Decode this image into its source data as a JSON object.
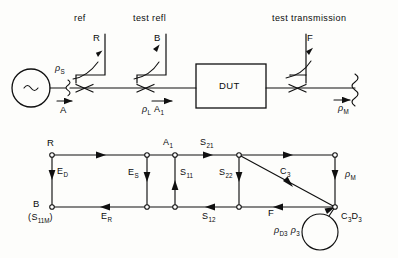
{
  "figure": {
    "line_color": "#101010"
  },
  "top_diagram": {
    "name": "measurement-setup",
    "headers": [
      {
        "id": "ref",
        "text": "ref"
      },
      {
        "id": "test-refl",
        "text": "test refl"
      },
      {
        "id": "test-transmission",
        "text": "test transmission"
      }
    ],
    "source": {
      "symbol": "~",
      "name": "signal-source"
    },
    "dut": {
      "label": "DUT"
    },
    "port_labels": [
      {
        "id": "R",
        "text": "R"
      },
      {
        "id": "B",
        "text": "B"
      },
      {
        "id": "F",
        "text": "F"
      }
    ],
    "wave_labels": [
      {
        "id": "rho-s",
        "rho": "ρ",
        "sub": "S"
      },
      {
        "id": "A",
        "text": "A"
      },
      {
        "id": "rho-L",
        "rho": "ρ",
        "sub": "L"
      },
      {
        "id": "A1",
        "text": "A",
        "sub": "1"
      },
      {
        "id": "rho-M",
        "rho": "ρ",
        "sub": "M"
      }
    ]
  },
  "flow_graph": {
    "name": "signal-flow-graph",
    "nodes": [
      {
        "id": "R",
        "text": "R"
      },
      {
        "id": "B",
        "text": "B"
      },
      {
        "id": "B-alt",
        "text": "(S",
        "sub1": "11M",
        "tail": ")"
      },
      {
        "id": "A1",
        "text": "A",
        "sub": "1"
      },
      {
        "id": "F",
        "text": "F"
      }
    ],
    "branches": [
      {
        "id": "ED",
        "text": "E",
        "sub": "D"
      },
      {
        "id": "ER",
        "text": "E",
        "sub": "R"
      },
      {
        "id": "ES",
        "text": "E",
        "sub": "S"
      },
      {
        "id": "S11",
        "text": "S",
        "sub": "11"
      },
      {
        "id": "S21",
        "text": "S",
        "sub": "21"
      },
      {
        "id": "S12",
        "text": "S",
        "sub": "12"
      },
      {
        "id": "S22",
        "text": "S",
        "sub": "22"
      },
      {
        "id": "C3",
        "text": "C",
        "sub": "3"
      },
      {
        "id": "rhoM",
        "rho": "ρ",
        "sub": "M"
      },
      {
        "id": "C3D3",
        "text": "C",
        "sub1": "3",
        "text2": "D",
        "sub2": "3"
      },
      {
        "id": "loop",
        "rho1": "ρ",
        "sub1": "D3",
        "rho2": "ρ",
        "sub2": "3"
      }
    ]
  }
}
